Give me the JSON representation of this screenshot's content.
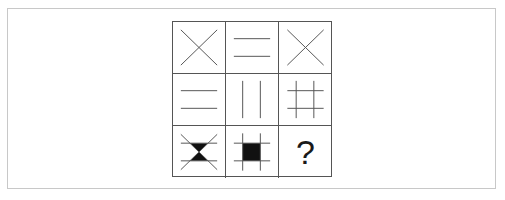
{
  "puzzle": {
    "type": "3x3 figure matrix",
    "line_color": "#555555",
    "fill_color": "#111111",
    "cells": [
      {
        "row": 1,
        "col": 1,
        "figure": "x-cross",
        "description": "Two diagonal lines forming an X"
      },
      {
        "row": 1,
        "col": 2,
        "figure": "two-horizontal-lines",
        "description": "Two parallel horizontal lines"
      },
      {
        "row": 1,
        "col": 3,
        "figure": "x-cross",
        "description": "Two diagonal lines forming an X"
      },
      {
        "row": 2,
        "col": 1,
        "figure": "two-horizontal-lines",
        "description": "Two parallel horizontal lines"
      },
      {
        "row": 2,
        "col": 2,
        "figure": "two-vertical-lines",
        "description": "Two parallel vertical lines"
      },
      {
        "row": 2,
        "col": 3,
        "figure": "hash-grid",
        "description": "Two horizontal and two vertical lines forming a # grid"
      },
      {
        "row": 3,
        "col": 1,
        "figure": "x-with-horizontal-lines-filled-hourglass",
        "description": "X crossed by two horizontal lines, the top and bottom triangles between the lines filled black"
      },
      {
        "row": 3,
        "col": 2,
        "figure": "hash-grid-filled-center",
        "description": "# grid with the center square filled black"
      },
      {
        "row": 3,
        "col": 3,
        "figure": "question-mark",
        "label": "?"
      }
    ]
  }
}
